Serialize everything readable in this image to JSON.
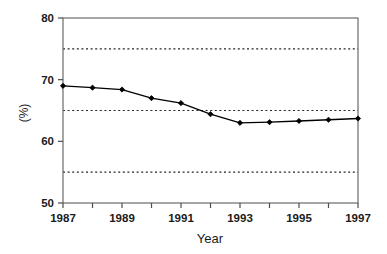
{
  "chart_data": {
    "type": "line",
    "title": "",
    "subtitle": "",
    "xlabel": "Year",
    "ylabel": "(%)",
    "xlim": [
      1987,
      1997
    ],
    "ylim": [
      50,
      80
    ],
    "grid": true,
    "grid_orientation": "horizontal",
    "grid_style": "dotted",
    "grid_values": [
      55,
      65,
      75
    ],
    "legend": null,
    "legend_position": "none",
    "x": [
      1987,
      1988,
      1989,
      1990,
      1991,
      1992,
      1993,
      1994,
      1995,
      1996,
      1997
    ],
    "y": [
      69.0,
      68.7,
      68.4,
      67.0,
      66.2,
      64.4,
      63.0,
      63.1,
      63.3,
      63.5,
      63.7
    ],
    "series": [
      {
        "name": "",
        "values": [
          69.0,
          68.7,
          68.4,
          67.0,
          66.2,
          64.4,
          63.0,
          63.1,
          63.3,
          63.5,
          63.7
        ],
        "marker": "filled-diamond",
        "color": "#000000",
        "line_color": "#000000"
      }
    ],
    "y_ticks": [
      50,
      60,
      70,
      80
    ],
    "y_tick_labels": [
      "50",
      "60",
      "70",
      "80"
    ],
    "x_ticks": [
      1987,
      1988,
      1989,
      1990,
      1991,
      1992,
      1993,
      1994,
      1995,
      1996,
      1997
    ],
    "x_tick_labels": [
      "1987",
      "",
      "1989",
      "",
      "1991",
      "",
      "1993",
      "",
      "1995",
      "",
      "1997"
    ],
    "x_labeled_ticks": [
      {
        "value": 1987,
        "label": "1987"
      },
      {
        "value": 1989,
        "label": "1989"
      },
      {
        "value": 1991,
        "label": "1991"
      },
      {
        "value": 1993,
        "label": "1993"
      },
      {
        "value": 1995,
        "label": "1995"
      },
      {
        "value": 1997,
        "label": "1997"
      }
    ],
    "colors": {
      "background": "#ffffff",
      "axis": "#4d4d4d",
      "grid": "#262626",
      "series": "#000000",
      "text": "#1b1b1b"
    }
  }
}
